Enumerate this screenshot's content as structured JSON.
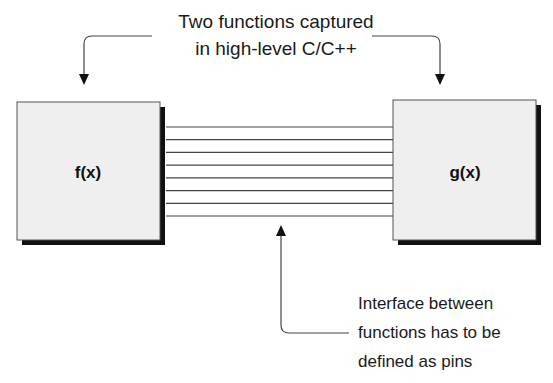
{
  "top_label": {
    "lines": [
      "Two functions captured",
      "in high-level C/C++"
    ]
  },
  "blocks": [
    {
      "id": "f",
      "label": "f(x)"
    },
    {
      "id": "g",
      "label": "g(x)"
    }
  ],
  "interface": {
    "pin_count": 8
  },
  "bottom_label": {
    "lines": [
      "Interface between",
      "functions has to be",
      "defined as pins"
    ]
  },
  "colors": {
    "box_fill": "#efefef",
    "box_stroke": "#555555",
    "shadow": "#111111",
    "line": "#444444",
    "text": "#1a1a1a"
  }
}
